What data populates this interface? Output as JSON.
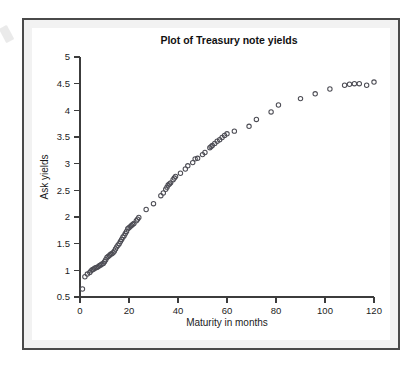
{
  "chart_data": {
    "type": "scatter",
    "title": "Plot of Treasury note yields",
    "xlabel": "Maturity in months",
    "ylabel": "Ask yields",
    "xlim": [
      0,
      120
    ],
    "ylim": [
      0.5,
      5
    ],
    "xticks": [
      0,
      20,
      40,
      60,
      80,
      100,
      120
    ],
    "yticks": [
      0.5,
      1,
      1.5,
      2,
      2.5,
      3,
      3.5,
      4,
      4.5,
      5
    ],
    "xtick_labels": [
      "0",
      "20",
      "40",
      "60",
      "80",
      "100",
      "120"
    ],
    "ytick_labels": [
      "0.5",
      "1",
      "1.5",
      "2",
      "2.5",
      "3",
      "3.5",
      "4",
      "4.5",
      "5"
    ],
    "grid": false,
    "legend": false,
    "marker": "open-circle",
    "marker_color": "#4d4d55",
    "series": [
      {
        "name": "Ask yields",
        "points": [
          [
            1,
            0.65
          ],
          [
            2,
            0.88
          ],
          [
            3,
            0.93
          ],
          [
            4,
            0.96
          ],
          [
            4.5,
            0.99
          ],
          [
            5,
            1.01
          ],
          [
            5.5,
            1.02
          ],
          [
            6,
            1.04
          ],
          [
            6.5,
            1.05
          ],
          [
            7,
            1.06
          ],
          [
            7.5,
            1.07
          ],
          [
            8,
            1.09
          ],
          [
            8.5,
            1.1
          ],
          [
            9,
            1.12
          ],
          [
            9.5,
            1.13
          ],
          [
            10,
            1.16
          ],
          [
            10.5,
            1.2
          ],
          [
            11,
            1.24
          ],
          [
            11.5,
            1.26
          ],
          [
            12,
            1.28
          ],
          [
            12.5,
            1.3
          ],
          [
            13,
            1.31
          ],
          [
            13.5,
            1.33
          ],
          [
            14,
            1.36
          ],
          [
            14.5,
            1.4
          ],
          [
            15,
            1.44
          ],
          [
            15.5,
            1.47
          ],
          [
            16,
            1.5
          ],
          [
            16.5,
            1.54
          ],
          [
            17,
            1.58
          ],
          [
            17.5,
            1.62
          ],
          [
            18,
            1.65
          ],
          [
            18.5,
            1.69
          ],
          [
            19,
            1.73
          ],
          [
            19.5,
            1.78
          ],
          [
            20,
            1.8
          ],
          [
            20.5,
            1.82
          ],
          [
            21,
            1.84
          ],
          [
            21.5,
            1.86
          ],
          [
            22,
            1.88
          ],
          [
            23,
            1.93
          ],
          [
            23.5,
            1.96
          ],
          [
            24,
            1.99
          ],
          [
            27,
            2.14
          ],
          [
            30,
            2.25
          ],
          [
            33,
            2.4
          ],
          [
            34,
            2.45
          ],
          [
            35,
            2.52
          ],
          [
            35.5,
            2.56
          ],
          [
            36,
            2.6
          ],
          [
            36.5,
            2.62
          ],
          [
            37,
            2.64
          ],
          [
            38,
            2.7
          ],
          [
            38.5,
            2.73
          ],
          [
            39,
            2.76
          ],
          [
            41,
            2.82
          ],
          [
            43,
            2.9
          ],
          [
            44,
            2.96
          ],
          [
            46,
            3.02
          ],
          [
            47,
            3.09
          ],
          [
            48,
            3.1
          ],
          [
            50,
            3.17
          ],
          [
            51,
            3.21
          ],
          [
            53,
            3.3
          ],
          [
            53.5,
            3.32
          ],
          [
            54,
            3.34
          ],
          [
            55,
            3.38
          ],
          [
            56,
            3.42
          ],
          [
            57,
            3.45
          ],
          [
            58,
            3.49
          ],
          [
            59,
            3.53
          ],
          [
            60,
            3.56
          ],
          [
            63,
            3.61
          ],
          [
            69,
            3.7
          ],
          [
            72,
            3.83
          ],
          [
            78,
            3.97
          ],
          [
            81,
            4.1
          ],
          [
            90,
            4.22
          ],
          [
            96,
            4.31
          ],
          [
            102,
            4.4
          ],
          [
            108,
            4.47
          ],
          [
            110,
            4.49
          ],
          [
            112,
            4.5
          ],
          [
            114,
            4.5
          ],
          [
            117,
            4.47
          ],
          [
            120,
            4.53
          ]
        ]
      }
    ]
  },
  "figure": {
    "border_color": "#4a4a4a",
    "background_color": "#ffffff",
    "mat_color": "#f2f2f2"
  }
}
